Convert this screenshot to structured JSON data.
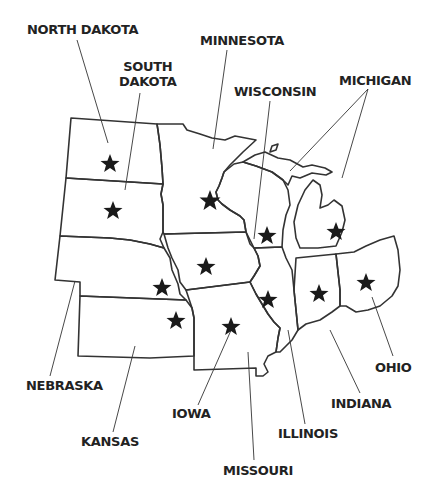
{
  "map": {
    "title": "Midwest United States",
    "states": [
      {
        "id": "north-dakota",
        "label": "NORTH DAKOTA"
      },
      {
        "id": "south-dakota",
        "label_line1": "SOUTH",
        "label_line2": "DAKOTA"
      },
      {
        "id": "minnesota",
        "label": "MINNESOTA"
      },
      {
        "id": "wisconsin",
        "label": "WISCONSIN"
      },
      {
        "id": "michigan",
        "label": "MICHIGAN"
      },
      {
        "id": "nebraska",
        "label": "NEBRASKA"
      },
      {
        "id": "kansas",
        "label": "KANSAS"
      },
      {
        "id": "iowa",
        "label": "IOWA"
      },
      {
        "id": "missouri",
        "label": "MISSOURI"
      },
      {
        "id": "illinois",
        "label": "ILLINOIS"
      },
      {
        "id": "indiana",
        "label": "INDIANA"
      },
      {
        "id": "ohio",
        "label": "OHIO"
      }
    ],
    "capital_marker": "star",
    "colors": {
      "outline": "#333333",
      "star": "#1a1a1a",
      "text": "#222222",
      "background": "#ffffff"
    }
  }
}
